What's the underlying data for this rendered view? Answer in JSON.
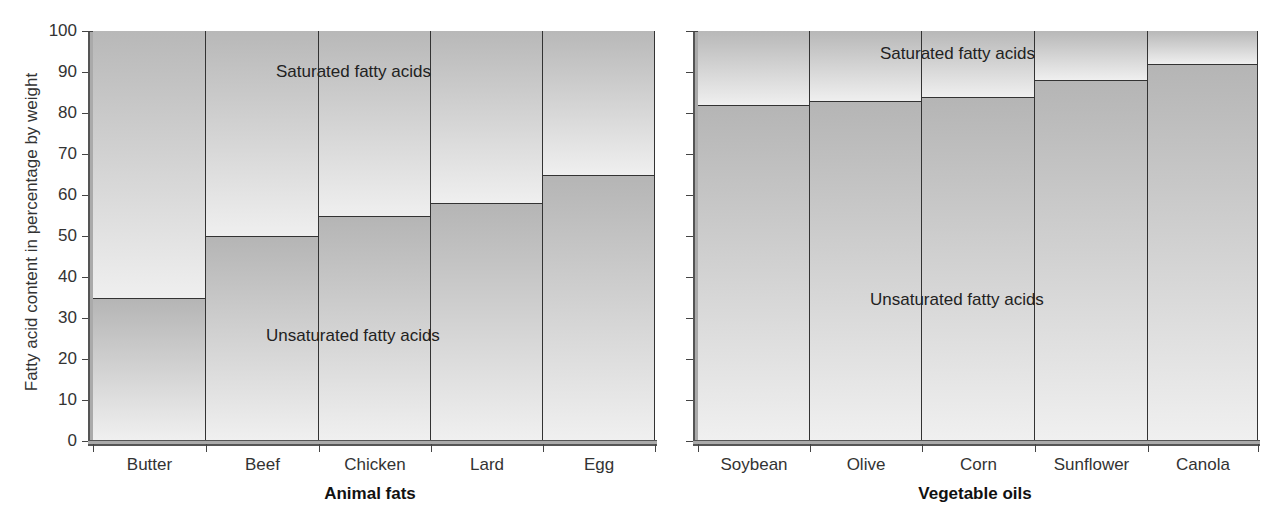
{
  "chart_data": {
    "type": "bar",
    "stacked": true,
    "ylabel": "Fatty acid content in percentage by weight",
    "ylim": [
      0,
      100
    ],
    "yticks": [
      0,
      10,
      20,
      30,
      40,
      50,
      60,
      70,
      80,
      90,
      100
    ],
    "grid": false,
    "panels": [
      {
        "xlabel": "Animal fats",
        "categories": [
          "Butter",
          "Beef",
          "Chicken",
          "Lard",
          "Egg"
        ],
        "series": [
          {
            "name": "Unsaturated fatty acids",
            "values": [
              35,
              50,
              55,
              58,
              65
            ]
          },
          {
            "name": "Saturated fatty acids",
            "values": [
              65,
              50,
              45,
              42,
              35
            ]
          }
        ],
        "annotations": [
          "Saturated fatty acids",
          "Unsaturated fatty acids"
        ]
      },
      {
        "xlabel": "Vegetable oils",
        "categories": [
          "Soybean",
          "Olive",
          "Corn",
          "Sunflower",
          "Canola"
        ],
        "series": [
          {
            "name": "Unsaturated fatty acids",
            "values": [
              82,
              83,
              84,
              88,
              92
            ]
          },
          {
            "name": "Saturated fatty acids",
            "values": [
              18,
              17,
              16,
              12,
              8
            ]
          }
        ],
        "annotations": [
          "Saturated fatty acids",
          "Unsaturated fatty acids"
        ]
      }
    ]
  },
  "labels": {
    "ylabel": "Fatty acid content in percentage by weight",
    "yticks": [
      "0",
      "10",
      "20",
      "30",
      "40",
      "50",
      "60",
      "70",
      "80",
      "90",
      "100"
    ],
    "left": {
      "group": "Animal fats",
      "categories": [
        "Butter",
        "Beef",
        "Chicken",
        "Lard",
        "Egg"
      ],
      "sat_annot": "Saturated fatty acids",
      "unsat_annot": "Unsaturated fatty acids"
    },
    "right": {
      "group": "Vegetable oils",
      "categories": [
        "Soybean",
        "Olive",
        "Corn",
        "Sunflower",
        "Canola"
      ],
      "sat_annot": "Saturated fatty acids",
      "unsat_annot": "Unsaturated fatty acids"
    }
  }
}
